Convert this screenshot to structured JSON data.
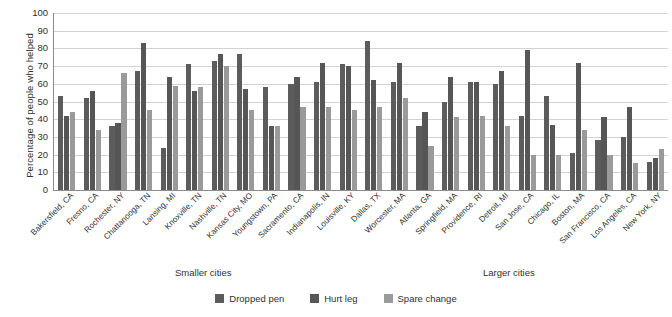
{
  "chart_data": {
    "type": "bar",
    "title": "",
    "xlabel": "",
    "ylabel": "Percentage of people who helped",
    "ylim": [
      0,
      100
    ],
    "ytick_step": 10,
    "yticks": [
      100,
      90,
      80,
      70,
      60,
      50,
      40,
      30,
      20,
      10,
      0
    ],
    "grid": true,
    "legend_position": "bottom-center",
    "group_captions": {
      "left": "Smaller cities",
      "right": "Larger cities"
    },
    "categories": [
      "Bakersfield, CA",
      "Fresno, CA",
      "Rochester, NY",
      "Chattanooga, TN",
      "Lansing, MI",
      "Knoxville, TN",
      "Nashville, TN",
      "Kansas City, MO",
      "Youngstown, PA",
      "Sacramento, CA",
      "Indianapolis, IN",
      "Louisville, KY",
      "Dallas, TX",
      "Worcester, MA",
      "Atlanta, GA",
      "Springfield, MA",
      "Providence, RI",
      "Detroit, MI",
      "San Jose, CA",
      "Chicago, IL",
      "Boston, MA",
      "San Francisco, CA",
      "Los Angeles, CA",
      "New York, NY"
    ],
    "series": [
      {
        "name": "Dropped pen",
        "color": "#5c5c5c",
        "values": [
          53,
          52,
          36,
          67,
          24,
          71,
          73,
          77,
          58,
          60,
          61,
          71,
          84,
          61,
          36,
          50,
          61,
          60,
          42,
          53,
          21,
          28,
          30,
          16
        ]
      },
      {
        "name": "Hurt leg",
        "color": "#565656",
        "values": [
          42,
          56,
          38,
          83,
          64,
          56,
          77,
          57,
          36,
          64,
          72,
          70,
          62,
          72,
          44,
          64,
          61,
          67,
          79,
          37,
          72,
          41,
          47,
          18
        ]
      },
      {
        "name": "Spare change",
        "color": "#9a9a9a",
        "values": [
          44,
          34,
          66,
          45,
          59,
          58,
          70,
          45,
          36,
          47,
          47,
          45,
          47,
          52,
          25,
          41,
          42,
          36,
          20,
          20,
          34,
          20,
          15,
          23
        ]
      }
    ]
  },
  "legend": {
    "items": [
      {
        "label": "Dropped pen"
      },
      {
        "label": "Hurt leg"
      },
      {
        "label": "Spare change"
      }
    ]
  }
}
